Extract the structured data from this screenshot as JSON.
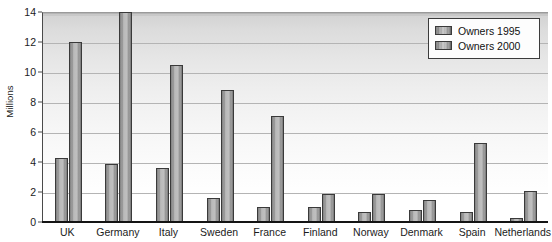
{
  "chart_data": {
    "type": "bar",
    "title": "",
    "xlabel": "",
    "ylabel": "Millions",
    "ylim": [
      0,
      14
    ],
    "yticks": [
      0,
      2,
      4,
      6,
      8,
      10,
      12,
      14
    ],
    "grid": true,
    "legend_position": "top-right",
    "categories": [
      "UK",
      "Germany",
      "Italy",
      "Sweden",
      "France",
      "Finland",
      "Norway",
      "Denmark",
      "Spain",
      "Netherlands"
    ],
    "series": [
      {
        "name": "Owners 1995",
        "values": [
          4.3,
          3.9,
          3.6,
          1.6,
          1.0,
          1.0,
          0.7,
          0.8,
          0.7,
          0.3
        ]
      },
      {
        "name": "Owners 2000",
        "values": [
          12.0,
          14.0,
          10.5,
          8.8,
          7.1,
          1.9,
          1.9,
          1.5,
          5.3,
          2.1
        ]
      }
    ]
  },
  "legend": {
    "items": [
      {
        "label": "Owners 1995"
      },
      {
        "label": "Owners 2000"
      }
    ]
  },
  "axes": {
    "y_title": "Millions"
  },
  "colors": {
    "bar_light": "#c2c2c2",
    "bar_dark": "#6e6e6e",
    "bar_outline": "#3a3a3a",
    "gridline": "#b4b4b4",
    "axis": "#141414",
    "plot_top": "#d2d2d2",
    "plot_bottom": "#ffffff",
    "text": "#1b1b1b"
  }
}
